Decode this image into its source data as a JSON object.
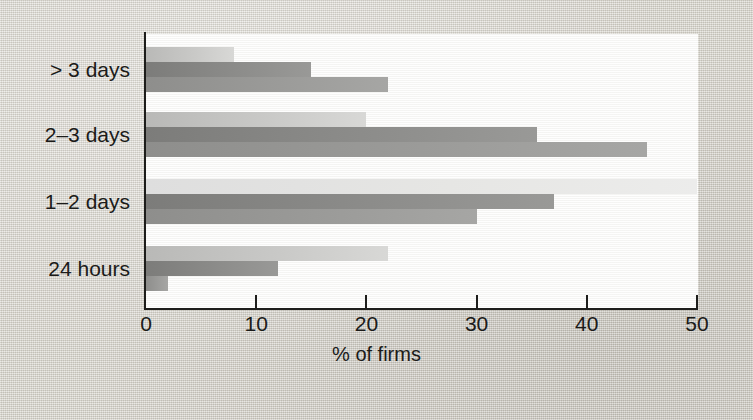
{
  "chart_data": {
    "type": "bar",
    "orientation": "horizontal",
    "title": "",
    "xlabel": "% of firms",
    "ylabel": "",
    "xlim": [
      0,
      50
    ],
    "xticks": [
      0,
      10,
      20,
      30,
      40,
      50
    ],
    "xtick_labels": [
      "0",
      "10",
      "20",
      "30",
      "40",
      "50"
    ],
    "grid": false,
    "legend": "none",
    "categories": [
      "> 3 days",
      "2–3 days",
      "1–2 days",
      "24 hours"
    ],
    "series": [
      {
        "name": "series-1",
        "values": [
          8,
          20,
          50,
          22
        ]
      },
      {
        "name": "series-2",
        "values": [
          15,
          35.5,
          37,
          12
        ]
      },
      {
        "name": "series-3",
        "values": [
          22,
          45.5,
          30,
          2
        ]
      }
    ],
    "colors": [
      "#c9c9c7",
      "#8c8c8a",
      "#9b9b99"
    ]
  },
  "figure": {
    "background_color": "#d7d4cc",
    "plot_background_color": "#fdfdfc",
    "axis_color": "#1d1d1b"
  }
}
